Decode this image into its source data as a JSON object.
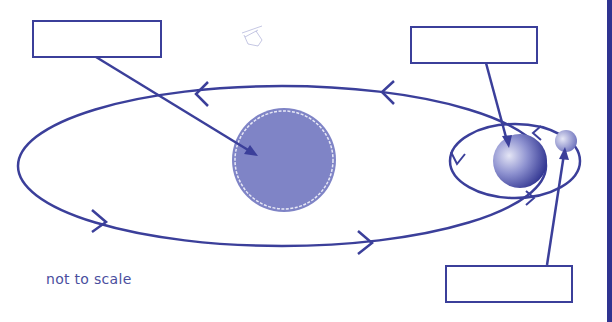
{
  "diagram": {
    "caption": "not to scale",
    "colors": {
      "line": "#3b3f9a",
      "sun_fill": "#7f84c6",
      "sun_halo": "#e8e9f6",
      "earth_light": "#d9dbf0",
      "earth_dark": "#2f3390",
      "moon_light": "#dfe0f3",
      "moon_dark": "#6a6fbb",
      "edge_bar": "#2f3390"
    },
    "label_boxes": [
      {
        "id": "sun-label",
        "text": "",
        "points_to": "sun"
      },
      {
        "id": "earth-label",
        "text": "",
        "points_to": "earth"
      },
      {
        "id": "moon-label",
        "text": "",
        "points_to": "moon"
      }
    ],
    "bodies": [
      "sun",
      "earth",
      "moon"
    ],
    "orbits": [
      "earth-orbit-around-sun",
      "moon-orbit-around-earth"
    ]
  }
}
